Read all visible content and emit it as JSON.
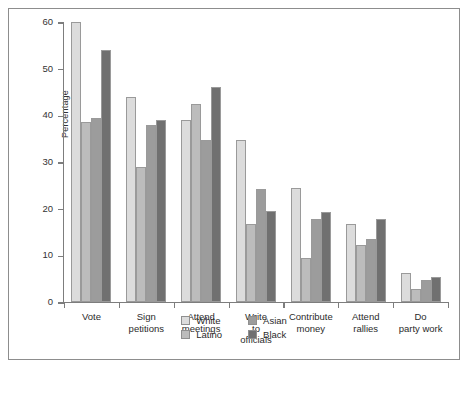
{
  "chart_data": {
    "type": "bar",
    "title": "",
    "xlabel": "",
    "ylabel": "Percentage",
    "ylim": [
      0,
      60
    ],
    "yticks": [
      0,
      10,
      20,
      30,
      40,
      50,
      60
    ],
    "grid": false,
    "legend_position": "bottom-center",
    "categories": [
      "Vote",
      "Sign petitions",
      "Attend meetings",
      "Write to officials",
      "Contribute money",
      "Attend rallies",
      "Do party work"
    ],
    "category_lines": [
      [
        "Vote"
      ],
      [
        "Sign",
        "petitions"
      ],
      [
        "Attend",
        "meetings"
      ],
      [
        "Write",
        "to",
        "officials"
      ],
      [
        "Contribute",
        "money"
      ],
      [
        "Attend",
        "rallies"
      ],
      [
        "Do",
        "party work"
      ]
    ],
    "series": [
      {
        "name": "White",
        "color": "#dcdcdc",
        "values": [
          60.0,
          44.0,
          39.0,
          34.8,
          24.5,
          16.7,
          6.3
        ]
      },
      {
        "name": "Latino",
        "color": "#bcbcbc",
        "values": [
          38.5,
          29.0,
          42.5,
          16.8,
          9.5,
          12.2,
          2.8
        ]
      },
      {
        "name": "Asian",
        "color": "#9c9c9c",
        "values": [
          39.5,
          38.0,
          34.8,
          24.3,
          17.8,
          13.5,
          4.8
        ]
      },
      {
        "name": "Black",
        "color": "#707070",
        "values": [
          54.0,
          39.0,
          46.0,
          19.5,
          19.3,
          17.8,
          5.3
        ]
      }
    ],
    "legend_columns": [
      [
        "White",
        "Latino"
      ],
      [
        "Asian",
        "Black"
      ]
    ]
  }
}
